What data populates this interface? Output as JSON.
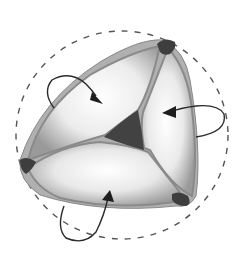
{
  "diagram": {
    "leaflet_count": 3,
    "arrow_count": 3,
    "colors": {
      "background": "#ffffff",
      "leaflet_fill": "#f4f4f4",
      "leaflet_shade": "#a8a8a8",
      "commissure": "#3e3e3e",
      "center_gap": "#424242",
      "outline_dashed": "#555555",
      "arrow": "#2a2a2a"
    }
  }
}
